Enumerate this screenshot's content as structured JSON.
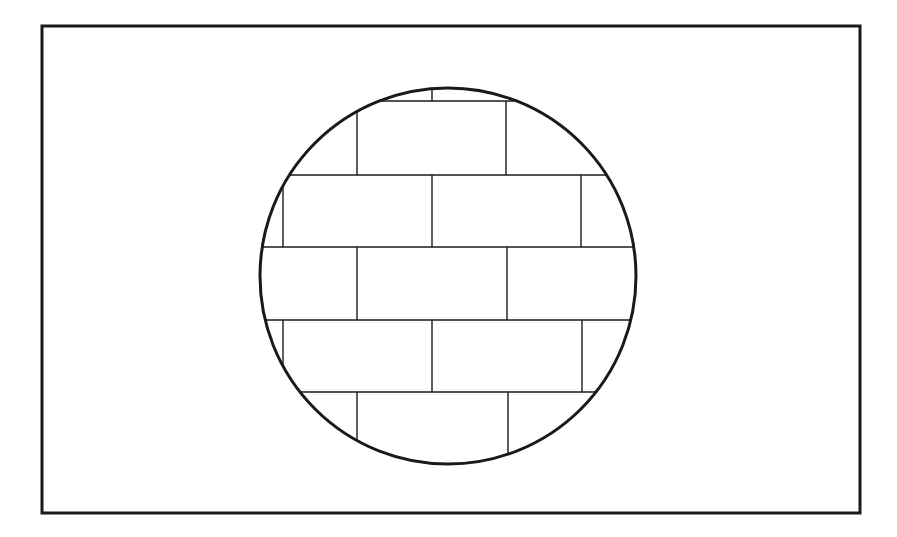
{
  "diagram": {
    "colors": {
      "background": "#ffffff",
      "stroke": "#1a1a1a"
    },
    "frame": {
      "x": 42,
      "y": 26,
      "width": 818,
      "height": 487,
      "stroke_width": 3
    },
    "circle": {
      "cx": 448,
      "cy": 276,
      "r": 188,
      "stroke_width": 3
    },
    "brick_pattern": {
      "line_width": 1.4,
      "courses": [
        {
          "y_top": 88,
          "y_bottom": 101,
          "joints": [
            432
          ]
        },
        {
          "y_top": 101,
          "y_bottom": 175,
          "joints": [
            357,
            506
          ]
        },
        {
          "y_top": 175,
          "y_bottom": 247,
          "joints": [
            283,
            432,
            581
          ]
        },
        {
          "y_top": 247,
          "y_bottom": 320,
          "joints": [
            357,
            507
          ]
        },
        {
          "y_top": 320,
          "y_bottom": 392,
          "joints": [
            283,
            432,
            582
          ]
        },
        {
          "y_top": 392,
          "y_bottom": 464,
          "joints": [
            357,
            508
          ]
        }
      ],
      "bed_joints_y": [
        101,
        175,
        247,
        320,
        392
      ]
    }
  }
}
